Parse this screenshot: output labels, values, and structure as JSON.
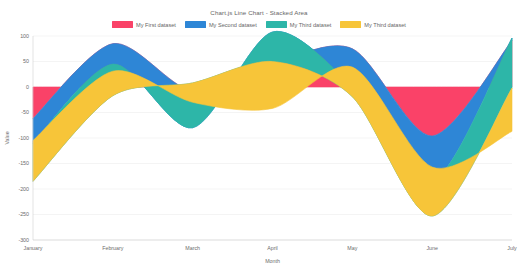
{
  "chart_data": {
    "type": "area",
    "title": "Chart.js Line Chart - Stacked Area",
    "xlabel": "Month",
    "ylabel": "Value",
    "stacked": true,
    "grid": true,
    "legend_position": "top",
    "categories": [
      "January",
      "February",
      "March",
      "April",
      "May",
      "June",
      "July"
    ],
    "ylim": [
      -300,
      100
    ],
    "yticks": [
      100,
      50,
      0,
      -50,
      -100,
      -150,
      -200,
      -250,
      -300
    ],
    "ytick_labels": [
      "100",
      "50",
      "0",
      "-50",
      "-100",
      "-150",
      "-200",
      "-250",
      "-300"
    ],
    "series": [
      {
        "name": "My First dataset",
        "color": "#fa4268",
        "values": [
          -62,
          85,
          -8,
          46,
          75,
          -96,
          91
        ]
      },
      {
        "name": "My Second dataset",
        "color": "#2e86d6",
        "values": [
          -48,
          -40,
          -72,
          62,
          -74,
          -90,
          5
        ]
      },
      {
        "name": "My Third dataset",
        "color": "#2db6a8",
        "values": [
          -75,
          -62,
          88,
          -58,
          -20,
          -67,
          -98
        ]
      },
      {
        "name": "My Third dataset",
        "color": "#f7c539",
        "values": [
          80,
          48,
          -38,
          -92,
          58,
          96,
          -85
        ]
      }
    ]
  },
  "legend": {
    "items": [
      {
        "label": "My First dataset",
        "color": "#fa4268"
      },
      {
        "label": "My Second dataset",
        "color": "#2e86d6"
      },
      {
        "label": "My Third dataset",
        "color": "#2db6a8"
      },
      {
        "label": "My Third dataset",
        "color": "#f7c539"
      }
    ]
  }
}
